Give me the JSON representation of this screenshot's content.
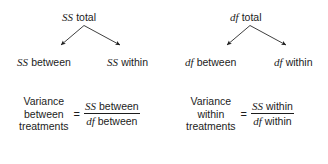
{
  "diagram": {
    "title_text": "ANOVA partitioning of SS and df",
    "line_color": "#1c1c1c",
    "background_color": "#ffffff",
    "trees": [
      {
        "id": "ss-tree",
        "root_symbol": "SS",
        "root_word": "total",
        "left_symbol": "SS",
        "left_word": "between",
        "right_symbol": "SS",
        "right_word": "within"
      },
      {
        "id": "df-tree",
        "root_symbol": "df",
        "root_word": "total",
        "left_symbol": "df",
        "left_word": "between",
        "right_symbol": "df",
        "right_word": "within"
      }
    ],
    "formulas": [
      {
        "id": "variance-between",
        "lhs_line1": "Variance",
        "lhs_line2": "between",
        "lhs_line3": "treatments",
        "equals": "=",
        "numerator_symbol": "SS",
        "numerator_word": "between",
        "denominator_symbol": "df",
        "denominator_word": "between"
      },
      {
        "id": "variance-within",
        "lhs_line1": "Variance",
        "lhs_line2": "within",
        "lhs_line3": "treatments",
        "equals": "=",
        "numerator_symbol": "SS",
        "numerator_word": "within",
        "denominator_symbol": "df",
        "denominator_word": "within"
      }
    ]
  }
}
